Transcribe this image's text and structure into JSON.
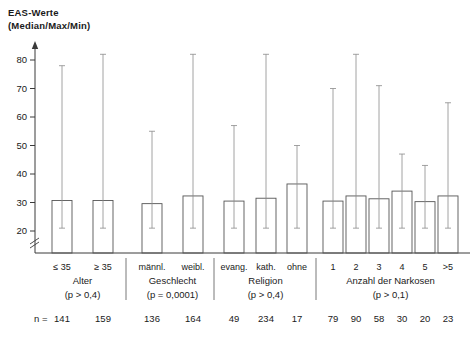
{
  "axis": {
    "title_line1": "EAS-Werte",
    "title_line2": "(Median/Max/Min)",
    "y_ticks": [
      "80",
      "70",
      "60",
      "50",
      "40",
      "30",
      "20"
    ],
    "n_prefix": "n ="
  },
  "caption": "",
  "chart_data": {
    "type": "bar",
    "title": "EAS-Werte (Median/Max/Min)",
    "xlabel": "",
    "ylabel": "EAS-Werte (Median/Max/Min)",
    "ylim": [
      18,
      84
    ],
    "yticks": [
      20,
      30,
      40,
      50,
      60,
      70,
      80
    ],
    "grid": false,
    "legend": "none",
    "groups": [
      {
        "name": "Alter",
        "p_value": "(p > 0,4)",
        "categories": [
          "≤ 35",
          "≥ 35"
        ],
        "median": [
          30.7,
          30.7
        ],
        "max": [
          78,
          82
        ],
        "min": [
          21,
          21
        ],
        "n": [
          141,
          159
        ]
      },
      {
        "name": "Geschlecht",
        "p_value": "(p = 0,0001)",
        "categories": [
          "männl.",
          "weibl."
        ],
        "median": [
          29.6,
          32.3
        ],
        "max": [
          55,
          82
        ],
        "min": [
          21,
          21
        ],
        "n": [
          136,
          164
        ]
      },
      {
        "name": "Religion",
        "p_value": "(p > 0,4)",
        "categories": [
          "evang.",
          "kath.",
          "ohne"
        ],
        "median": [
          30.5,
          31.5,
          36.5
        ],
        "max": [
          57,
          82,
          50
        ],
        "min": [
          21,
          21,
          21
        ],
        "n": [
          49,
          234,
          17
        ]
      },
      {
        "name": "Anzahl der Narkosen",
        "p_value": "(p > 0,1)",
        "categories": [
          "1",
          "2",
          "3",
          "4",
          "5",
          ">5"
        ],
        "median": [
          30.5,
          32.3,
          31.3,
          34.0,
          30.3,
          32.3
        ],
        "max": [
          70,
          82,
          71,
          47,
          43,
          65
        ],
        "min": [
          21,
          21,
          21,
          21,
          21,
          21
        ],
        "n": [
          79,
          90,
          58,
          30,
          20,
          23
        ]
      }
    ]
  }
}
